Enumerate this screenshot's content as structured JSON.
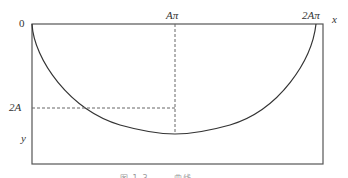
{
  "diagram": {
    "labels": {
      "origin": "0",
      "a_pi": "Aπ",
      "two_a_pi": "2Aπ",
      "x_axis": "x",
      "two_a": "2A",
      "y_axis": "y"
    },
    "caption": "图 1-3  ……  曲线",
    "colors": {
      "curve": "#333333",
      "frame": "#555555",
      "dashed": "#666666"
    }
  }
}
